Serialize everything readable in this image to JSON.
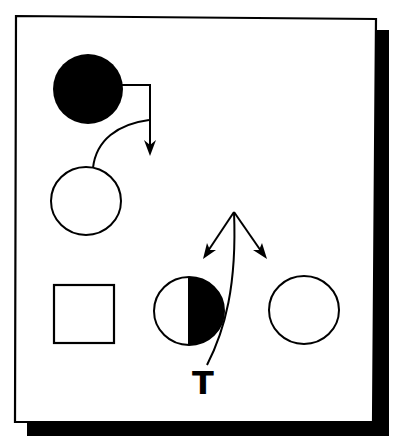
{
  "diagram": {
    "type": "pedigree",
    "colors": {
      "background": "#ffffff",
      "stroke": "#000000",
      "fill_affected": "#000000",
      "fill_unaffected": "#ffffff",
      "shadow": "#000000"
    },
    "frame": {
      "has_drop_shadow": true
    },
    "nodes": [
      {
        "id": "parent-female-affected",
        "shape": "circle",
        "fill": "full",
        "generation": 1
      },
      {
        "id": "parent-female-unaffected",
        "shape": "circle",
        "fill": "none",
        "generation": 2
      },
      {
        "id": "offspring-male-unaffected",
        "shape": "square",
        "fill": "none",
        "generation": 3
      },
      {
        "id": "offspring-female-carrier",
        "shape": "circle",
        "fill": "right-half",
        "generation": 3
      },
      {
        "id": "offspring-female-unaffected",
        "shape": "circle",
        "fill": "none",
        "generation": 3
      }
    ],
    "edges": [
      {
        "from": "parent-female-affected",
        "kind": "elbow-arrow-down"
      },
      {
        "from": "parent-female-unaffected",
        "kind": "curve-join"
      },
      {
        "from": "label-T",
        "kind": "curve-up-split-arrows",
        "targets": [
          "left",
          "right"
        ]
      }
    ],
    "labels": {
      "t": "T"
    }
  }
}
